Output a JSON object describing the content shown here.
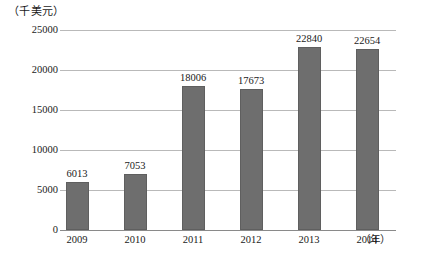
{
  "chart_data": {
    "type": "bar",
    "title": "",
    "subtitle": "",
    "unit_caption": "（千美元）",
    "xlabel": "（年）",
    "ylabel": "",
    "categories": [
      "2009",
      "2010",
      "2011",
      "2012",
      "2013",
      "2014"
    ],
    "values": [
      6013,
      7053,
      18006,
      17673,
      22840,
      22654
    ],
    "value_labels": [
      "6013",
      "7053",
      "18006",
      "17673",
      "22840",
      "22654"
    ],
    "ylim": [
      0,
      25000
    ],
    "yticks": [
      0,
      5000,
      10000,
      15000,
      20000,
      25000
    ],
    "ytick_labels": [
      "0",
      "5000",
      "10000",
      "15000",
      "20000",
      "25000"
    ],
    "grid": true,
    "legend": false,
    "legend_position": "none",
    "series": [
      {
        "name": "",
        "values": [
          6013,
          7053,
          18006,
          17673,
          22840,
          22654
        ],
        "color": "#6e6e6e"
      }
    ],
    "colors": {
      "bar_fill": "#6e6e6e",
      "bar_stroke": "#5f5f5f",
      "gridline": "#b9b9b9",
      "axis": "#8a8a8a",
      "text": "#1a1a1a",
      "background": "#ffffff"
    }
  }
}
